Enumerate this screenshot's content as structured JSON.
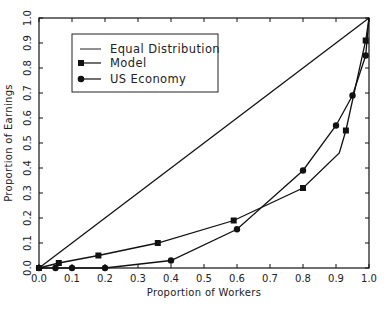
{
  "chart_data": {
    "type": "line",
    "title": "",
    "xlabel": "Proportion of Workers",
    "ylabel": "Proportion of Earnings",
    "xlim": [
      0.0,
      1.0
    ],
    "ylim": [
      0.0,
      1.0
    ],
    "grid": false,
    "legend_position": "upper-left (inset box)",
    "x_ticks": [
      "0.0",
      "0.1",
      "0.2",
      "0.3",
      "0.4",
      "0.5",
      "0.6",
      "0.7",
      "0.8",
      "0.9",
      "1.0"
    ],
    "y_ticks": [
      "0.0",
      "0.1",
      "0.2",
      "0.3",
      "0.4",
      "0.5",
      "0.6",
      "0.7",
      "0.8",
      "0.9",
      "1.0"
    ],
    "series": [
      {
        "name": "Equal Distribution",
        "marker": "none",
        "x": [
          0.0,
          1.0
        ],
        "y": [
          0.0,
          1.0
        ]
      },
      {
        "name": "Model",
        "marker": "square",
        "x": [
          0.0,
          0.06,
          0.18,
          0.36,
          0.59,
          0.8,
          0.93,
          0.99,
          1.0
        ],
        "y": [
          0.0,
          0.02,
          0.05,
          0.1,
          0.19,
          0.32,
          0.55,
          0.91,
          1.0
        ],
        "unmarked_vertices": [
          {
            "x": 0.91,
            "y": 0.46
          }
        ]
      },
      {
        "name": "US Economy",
        "marker": "circle",
        "x": [
          0.0,
          0.05,
          0.1,
          0.2,
          0.4,
          0.6,
          0.8,
          0.9,
          0.95,
          0.99,
          1.0
        ],
        "y": [
          0.0,
          0.0,
          0.0,
          0.0,
          0.03,
          0.155,
          0.39,
          0.57,
          0.69,
          0.85,
          1.0
        ]
      }
    ]
  },
  "axes": {
    "x_title": "Proportion of Workers",
    "y_title": "Proportion of Earnings"
  },
  "legend": {
    "items": [
      {
        "label": "Equal Distribution",
        "marker": "none"
      },
      {
        "label": "Model",
        "marker": "square"
      },
      {
        "label": "US Economy",
        "marker": "circle"
      }
    ]
  },
  "colors": {
    "line": "#111111",
    "background": "#ffffff"
  }
}
